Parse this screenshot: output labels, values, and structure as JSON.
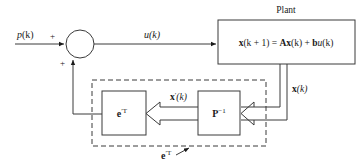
{
  "diagram": {
    "type": "block-diagram",
    "nodes": {
      "summing_junction": {
        "signs": {
          "left": "+",
          "bottom": "+"
        }
      },
      "plant": {
        "title": "Plant",
        "equation": {
          "lhs_bold": "x",
          "lhs_rest": "(k + 1) = ",
          "A": "A",
          "x": "x",
          "k1": "(k) + ",
          "b": "b",
          "u": "u",
          "k2": "(k)"
        }
      },
      "p_inverse": {
        "base": "P",
        "sup": "−1"
      },
      "e_transpose": {
        "base": "e",
        "sup": "′T"
      }
    },
    "signals": {
      "input": {
        "name": "p",
        "arg": "(k)"
      },
      "control": {
        "name": "u",
        "arg": "(k)"
      },
      "state": {
        "name": "x",
        "arg": "(k)"
      },
      "transformed_state": {
        "name": "x",
        "prime": "′",
        "arg": "(k)"
      }
    },
    "dashed_group_label": {
      "base": "e",
      "sup": "′T"
    },
    "plus_sign": "+"
  }
}
